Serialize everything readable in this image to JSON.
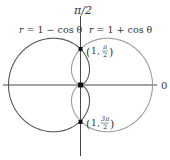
{
  "figure": {
    "axis_labels": {
      "polar_axis": "0",
      "vertical_axis": "π/2"
    },
    "curves": [
      {
        "name": "r = 1 − cos θ",
        "r_prefix": "r",
        "equation": "= 1 − cos θ",
        "color": "#555555"
      },
      {
        "name": "r = 1 + cos θ",
        "r_prefix": "r",
        "equation": "= 1 + cos θ",
        "color": "#9a9a9a"
      }
    ],
    "points": [
      {
        "label_r": "1",
        "label_theta_num": "π",
        "label_theta_den": "2",
        "polar": "(1, π/2)"
      },
      {
        "label_r": "1",
        "label_theta_num": "3π",
        "label_theta_den": "2",
        "polar": "(1, 3π/2)"
      }
    ],
    "colors": {
      "axis": "#333333",
      "point": "#111111",
      "text": "#333333"
    }
  }
}
